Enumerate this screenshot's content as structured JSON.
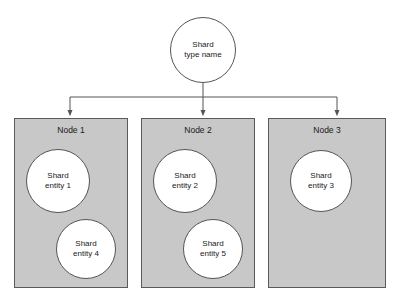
{
  "diagram": {
    "title": "Shard type name",
    "root": {
      "label": "Shard\ntype name",
      "cx": 203,
      "cy": 50,
      "r": 33
    },
    "colors": {
      "node_fill": "#c8c8c8",
      "node_border": "#5a5a5a",
      "circle_fill": "#ffffff",
      "circle_border": "#555555",
      "connector": "#555555",
      "text": "#1a1a1a",
      "background": "#ffffff"
    },
    "nodes": [
      {
        "label": "Node 1",
        "x": 14,
        "y": 118,
        "width": 114,
        "height": 170,
        "entities": [
          {
            "label": "Shard\nentity 1",
            "cx": 57,
            "cy": 180,
            "r": 32
          },
          {
            "label": "Shard\nentity 4",
            "cx": 85,
            "cy": 248,
            "r": 30
          }
        ]
      },
      {
        "label": "Node 2",
        "x": 141,
        "y": 118,
        "width": 114,
        "height": 170,
        "entities": [
          {
            "label": "Shard\nentity 2",
            "cx": 184,
            "cy": 180,
            "r": 32
          },
          {
            "label": "Shard\nentity 5",
            "cx": 212,
            "cy": 248,
            "r": 30
          }
        ]
      },
      {
        "label": "Node 3",
        "x": 268,
        "y": 118,
        "width": 118,
        "height": 170,
        "entities": [
          {
            "label": "Shard\nentity 3",
            "cx": 320,
            "cy": 180,
            "r": 31
          }
        ]
      }
    ],
    "connectors": {
      "stem_x": 203,
      "stem_top": 83,
      "bus_y": 97,
      "bus_left": 70,
      "bus_right": 337,
      "arrow_targets": [
        70,
        203,
        337
      ],
      "arrow_tip_y": 117
    }
  }
}
